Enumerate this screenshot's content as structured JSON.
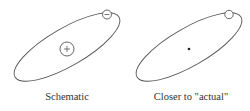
{
  "figure": {
    "panels": [
      {
        "caption": "Schematic",
        "orbit": "ellipse",
        "nucleus": "circle-with-plus",
        "electron": "circle-with-minus"
      },
      {
        "caption": "Closer to \"actual\"",
        "orbit": "ellipse",
        "nucleus": "dot",
        "electron": "small-circle"
      }
    ]
  },
  "colors": {
    "stroke": "#555555",
    "text": "#333333",
    "background": "#ffffff"
  }
}
